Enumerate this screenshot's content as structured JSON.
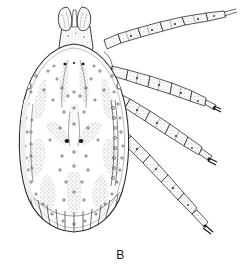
{
  "figure": {
    "panel_label": "B",
    "view": "dorsal",
    "style": "stippled line drawing",
    "canvas": {
      "width": 241,
      "height": 270,
      "background": "#ffffff"
    },
    "ink": {
      "outline": "#2b2b2b",
      "stipple": "#8a8a8a",
      "shadow": "#b4b4b4",
      "dark_accent": "#111111",
      "label": "#1a1a1a"
    }
  },
  "anatomy": {
    "capitulum": {
      "name": "capitulum",
      "palps": [
        "left-palp",
        "right-palp"
      ],
      "basis": "basis-capituli",
      "hypostome": "hypostome"
    },
    "body": {
      "name": "idiosoma",
      "shape": "ovoid",
      "scutum": "ornate-scutum",
      "eyes": [
        "left-eye-spot",
        "right-eye-spot"
      ],
      "festoons": 11,
      "ornamentation_patches": 9,
      "punctations": 64
    },
    "legs": [
      {
        "id": "leg-1",
        "position": "anterior-right",
        "segments": 6
      },
      {
        "id": "leg-2",
        "position": "second-right",
        "segments": 6
      },
      {
        "id": "leg-3",
        "position": "third-right",
        "segments": 6
      },
      {
        "id": "leg-4",
        "position": "posterior-right",
        "segments": 6
      }
    ]
  }
}
